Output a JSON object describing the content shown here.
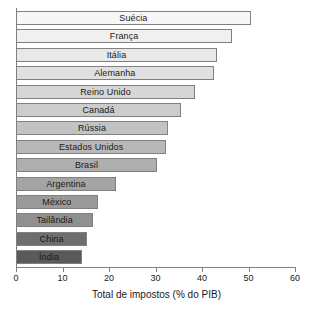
{
  "chart_data": {
    "type": "bar",
    "orientation": "horizontal",
    "title": "",
    "xlabel": "Total de impostos (% do PIB)",
    "ylabel": "",
    "xlim": [
      0,
      60
    ],
    "xticks": [
      0,
      10,
      20,
      30,
      40,
      50,
      60
    ],
    "grid": false,
    "legend": null,
    "categories": [
      "Suécia",
      "França",
      "Itália",
      "Alemanha",
      "Reino Unido",
      "Canadá",
      "Rússia",
      "Estados Unidos",
      "Brasil",
      "Argentina",
      "México",
      "Tailândia",
      "China",
      "Índia"
    ],
    "values": [
      50.5,
      46.5,
      43.2,
      42.5,
      38.5,
      35.5,
      32.7,
      32.3,
      30.3,
      21.5,
      17.6,
      16.6,
      15.3,
      14.2
    ],
    "bar_colors": [
      "#f7f7f7",
      "#f0f0f0",
      "#e8e8e8",
      "#e0e0e0",
      "#d6d6d6",
      "#cccccc",
      "#c2c2c2",
      "#b8b8b8",
      "#aeaeae",
      "#a4a4a4",
      "#9a9a9a",
      "#909090",
      "#6e6e6e",
      "#5a5a5a"
    ],
    "bar_border_color": "#808080"
  }
}
